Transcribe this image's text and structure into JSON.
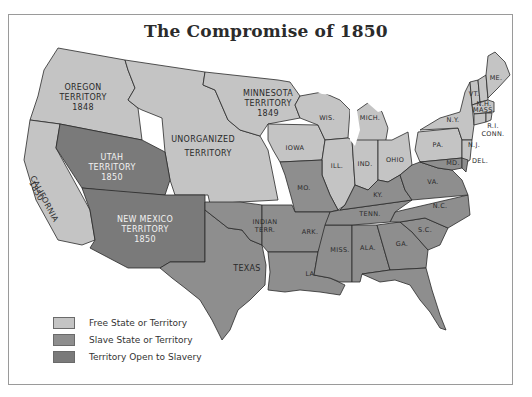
{
  "title": "The Compromise of 1850",
  "colors": {
    "free": "#c4c4c4",
    "slave": "#8e8e8e",
    "open": "#7a7a7a",
    "border": "#2a2a2a",
    "water": "#ffffff"
  },
  "legend": [
    {
      "label": "Free State or Territory",
      "color_key": "free"
    },
    {
      "label": "Slave State or Territory",
      "color_key": "slave"
    },
    {
      "label": "Territory Open to Slavery",
      "color_key": "open"
    }
  ],
  "regions": {
    "oregon": {
      "name": "OREGON",
      "line2": "TERRITORY",
      "year": "1848",
      "status": "free"
    },
    "california": {
      "name": "CALIFORNIA",
      "year": "1850",
      "status": "free"
    },
    "utah": {
      "name": "UTAH",
      "line2": "TERRITORY",
      "year": "1850",
      "status": "open"
    },
    "new_mexico": {
      "name": "NEW MEXICO",
      "line2": "TERRITORY",
      "year": "1850",
      "status": "open"
    },
    "unorganized": {
      "name": "UNORGANIZED",
      "line2": "TERRITORY",
      "status": "free"
    },
    "minnesota": {
      "name": "MINNESOTA",
      "line2": "TERRITORY",
      "year": "1849",
      "status": "free"
    },
    "iowa": {
      "name": "IOWA",
      "status": "free"
    },
    "wisconsin": {
      "name": "WIS.",
      "status": "free"
    },
    "michigan": {
      "name": "MICH.",
      "status": "free"
    },
    "illinois": {
      "name": "ILL.",
      "status": "free"
    },
    "indiana": {
      "name": "IND.",
      "status": "free"
    },
    "ohio": {
      "name": "OHIO",
      "status": "free"
    },
    "pennsylvania": {
      "name": "PA.",
      "status": "free"
    },
    "new_york": {
      "name": "N.Y.",
      "status": "free"
    },
    "new_jersey": {
      "name": "N.J.",
      "status": "free"
    },
    "vermont": {
      "name": "VT.",
      "status": "free"
    },
    "new_hampshire": {
      "name": "N.H.",
      "status": "free"
    },
    "maine": {
      "name": "ME.",
      "status": "free"
    },
    "massachusetts": {
      "name": "MASS.",
      "status": "free"
    },
    "rhode_island": {
      "name": "R.I.",
      "status": "free"
    },
    "connecticut": {
      "name": "CONN.",
      "status": "free"
    },
    "delaware": {
      "name": "DEL.",
      "status": "slave"
    },
    "maryland": {
      "name": "MD.",
      "status": "slave"
    },
    "missouri": {
      "name": "MO.",
      "status": "slave"
    },
    "kentucky": {
      "name": "KY.",
      "status": "slave"
    },
    "virginia": {
      "name": "VA.",
      "status": "slave"
    },
    "tennessee": {
      "name": "TENN.",
      "status": "slave"
    },
    "north_carolina": {
      "name": "N.C.",
      "status": "slave"
    },
    "south_carolina": {
      "name": "S.C.",
      "status": "slave"
    },
    "georgia": {
      "name": "GA.",
      "status": "slave"
    },
    "alabama": {
      "name": "ALA.",
      "status": "slave"
    },
    "mississippi": {
      "name": "MISS.",
      "status": "slave"
    },
    "louisiana": {
      "name": "LA.",
      "status": "slave"
    },
    "arkansas": {
      "name": "ARK.",
      "status": "slave"
    },
    "indian_territory": {
      "name": "INDIAN",
      "line2": "TERR.",
      "status": "slave"
    },
    "texas": {
      "name": "TEXAS",
      "status": "slave"
    }
  }
}
